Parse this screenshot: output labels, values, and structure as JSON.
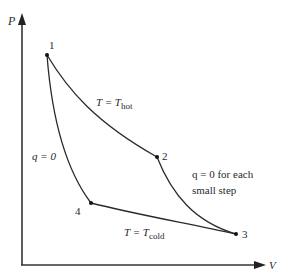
{
  "diagram": {
    "type": "PV diagram (Carnot cycle)",
    "axes": {
      "y_label": "P",
      "x_label": "V"
    },
    "points": [
      {
        "id": "1",
        "label": "1"
      },
      {
        "id": "2",
        "label": "2"
      },
      {
        "id": "3",
        "label": "3"
      },
      {
        "id": "4",
        "label": "4"
      }
    ],
    "curves": {
      "isotherm_hot": {
        "from": "1",
        "to": "2",
        "label_main": "T = T",
        "label_sub": "hot"
      },
      "adiabat_expansion": {
        "from": "2",
        "to": "3",
        "label_line1": "q = 0 for each",
        "label_line2": "small step"
      },
      "isotherm_cold": {
        "from": "3",
        "to": "4",
        "label_main": "T = T",
        "label_sub": "cold"
      },
      "adiabat_compression": {
        "from": "4",
        "to": "1",
        "label": "q = 0"
      }
    },
    "colors": {
      "line": "#2a2a2a",
      "axis": "#333333",
      "background": "#ffffff"
    }
  }
}
